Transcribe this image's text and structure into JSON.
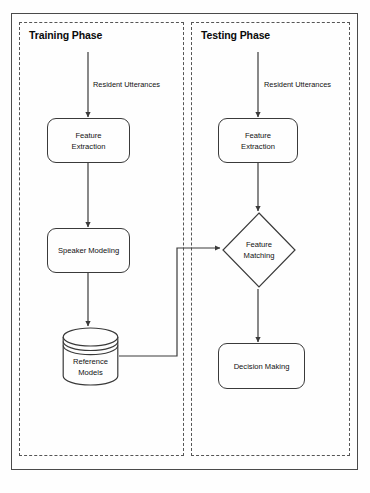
{
  "diagram": {
    "panels": [
      {
        "id": "training",
        "label": "Training Phase"
      },
      {
        "id": "testing",
        "label": "Testing Phase"
      }
    ],
    "nodes": [
      {
        "id": "feature-extraction-train",
        "label": "Feature\nExtraction",
        "shape": "rounded-rect",
        "panel": "training"
      },
      {
        "id": "speaker-modeling",
        "label": "Speaker Modeling",
        "shape": "rounded-rect",
        "panel": "training"
      },
      {
        "id": "reference-models",
        "label": "Reference\nModels",
        "shape": "cylinder",
        "panel": "training"
      },
      {
        "id": "feature-extraction-test",
        "label": "Feature\nExtraction",
        "shape": "rounded-rect",
        "panel": "testing"
      },
      {
        "id": "feature-matching",
        "label": "Feature\nMatching",
        "shape": "diamond",
        "panel": "testing"
      },
      {
        "id": "decision-making",
        "label": "Decision Making",
        "shape": "rounded-rect",
        "panel": "testing"
      }
    ],
    "edge_labels": {
      "utterances_train": "Resident Utterances",
      "utterances_test": "Resident Utterances"
    },
    "colors": {
      "stroke": "#3a3a3a",
      "panel_border": "#555555",
      "frame": "#4a4a4a",
      "text": "#111111",
      "background": "#fefefe"
    }
  }
}
